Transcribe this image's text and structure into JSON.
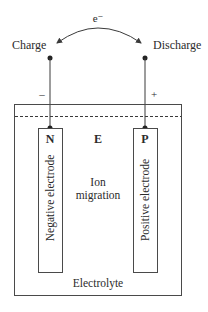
{
  "diagram": {
    "electron_label": "e⁻",
    "charge_label": "Charge",
    "discharge_label": "Discharge",
    "negative_sign": "–",
    "positive_sign": "+",
    "negative_electrode": {
      "letter": "N",
      "label": "Negative electrode"
    },
    "positive_electrode": {
      "letter": "P",
      "label": "Positive electrode"
    },
    "electrolyte_letter": "E",
    "ion_migration": {
      "line1": "Ion",
      "line2": "migration"
    },
    "electrolyte_label": "Electrolyte",
    "colors": {
      "line": "#3a3a3a",
      "text": "#2b2b2b",
      "background": "#ffffff"
    }
  }
}
